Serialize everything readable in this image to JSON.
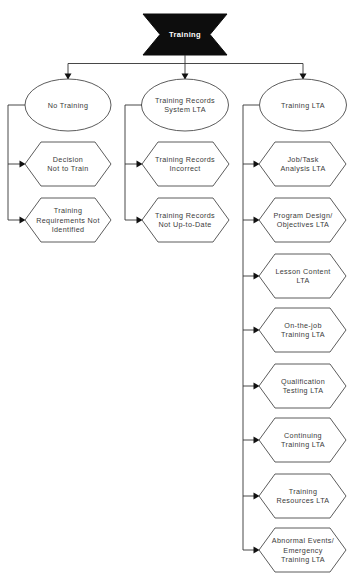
{
  "diagram": {
    "type": "fault-tree",
    "root": {
      "label": "Training"
    },
    "branches": [
      {
        "label": [
          "No Training"
        ],
        "children": [
          [
            "Decision",
            "Not to Train"
          ],
          [
            "Training",
            "Requirements Not",
            "Identified"
          ]
        ]
      },
      {
        "label": [
          "Training Records",
          "System LTA"
        ],
        "children": [
          [
            "Training Records",
            "Incorrect"
          ],
          [
            "Training Records",
            "Not Up-to-Date"
          ]
        ]
      },
      {
        "label": [
          "Training LTA"
        ],
        "children": [
          [
            "Job/Task",
            "Analysis LTA"
          ],
          [
            "Program Design/",
            "Objectives LTA"
          ],
          [
            "Lesson Content",
            "LTA"
          ],
          [
            "On-the-job",
            "Training LTA"
          ],
          [
            "Qualification",
            "Testing LTA"
          ],
          [
            "Continuing",
            "Training LTA"
          ],
          [
            "Training",
            "Resources LTA"
          ],
          [
            "Abnormal Events/",
            "Emergency",
            "Training LTA"
          ]
        ]
      }
    ],
    "colors": {
      "root_fill": "#0d0d0d",
      "root_text": "#ffffff",
      "node_stroke": "#4a4a4a",
      "connector": "#333333",
      "text": "#3a3a3a"
    }
  }
}
